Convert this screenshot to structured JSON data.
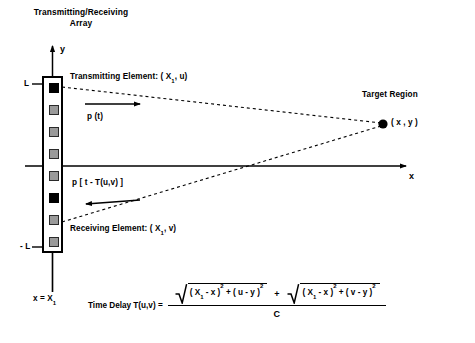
{
  "diagram": {
    "title_line1": "Transmitting/Receiving",
    "title_line2": "Array",
    "axes": {
      "y_label": "y",
      "x_label": "x",
      "top_tick_label": "L",
      "bottom_tick_label": "- L",
      "array_position_label": "x = X",
      "array_position_sub": "1"
    },
    "array": {
      "element_count": 8,
      "active_indices": [
        0,
        5
      ],
      "active_color": "#000000",
      "idle_color": "#9a9a9a",
      "border_color": "#000000"
    },
    "annotations": {
      "transmitting_element": {
        "text_pre": "Transmitting Element: ( X",
        "sub": "1",
        "text_post": ", u)"
      },
      "receiving_element": {
        "text_pre": "Receiving Element: ( X",
        "sub": "1",
        "text_post": ", v)"
      },
      "transmitted_signal": "p (t)",
      "received_signal": "p [ t - T(u,v) ]",
      "target_region": "Target Region",
      "target_point": "( x , y )"
    },
    "formula": {
      "label": "Time Delay T(u,v) =",
      "numerator": {
        "term1": {
          "open": "( X",
          "sub1": "1",
          "minus": " - x )",
          "exp1": "2",
          "plus": " + ( u - y )",
          "exp2": "2"
        },
        "operator": "+",
        "term2": {
          "open": "( X",
          "sub1": "1",
          "minus": " - x )",
          "exp1": "2",
          "plus": " + ( v - y )",
          "exp2": "2"
        }
      },
      "denominator": "C"
    }
  }
}
